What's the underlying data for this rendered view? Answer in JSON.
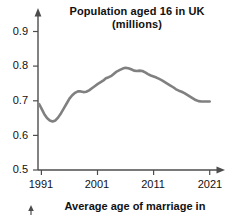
{
  "figure": {
    "background_color": "#ffffff",
    "line_color": "#808080",
    "axis_color": "#4d4d4d",
    "text_color": "#111111"
  },
  "title": {
    "line1": "Population aged 16 in UK",
    "line2": "(millions)"
  },
  "next_chart": {
    "partial_title": "Average age of marriage in"
  },
  "axes": {
    "y_tick_labels": [
      "0.9",
      "0.8",
      "0.7",
      "0.6",
      "0.5"
    ],
    "x_tick_labels": [
      "1991",
      "2001",
      "2011",
      "2021"
    ]
  },
  "chart_data": {
    "type": "line",
    "title": "Population aged 16 in UK (millions)",
    "xlabel": "",
    "ylabel": "",
    "xlim": [
      1990,
      2022
    ],
    "ylim": [
      0.5,
      0.93
    ],
    "yticks": [
      0.5,
      0.6,
      0.7,
      0.8,
      0.9
    ],
    "xticks": [
      1991,
      2001,
      2011,
      2021
    ],
    "grid": false,
    "legend": "none",
    "series": [
      {
        "name": "Population aged 16 in UK (millions)",
        "color": "#808080",
        "x": [
          1990.6,
          1991,
          1991.5,
          1992,
          1992.5,
          1993,
          1993.5,
          1994,
          1994.5,
          1995,
          1995.5,
          1996,
          1996.5,
          1997,
          1997.5,
          1998,
          1998.5,
          1999,
          1999.5,
          2000,
          2000.5,
          2001,
          2001.5,
          2002,
          2002.5,
          2003,
          2003.5,
          2004,
          2004.5,
          2005,
          2005.5,
          2006,
          2006.5,
          2007,
          2007.5,
          2008,
          2008.5,
          2009,
          2009.5,
          2010,
          2010.5,
          2011,
          2011.5,
          2012,
          2012.5,
          2013,
          2013.5,
          2014,
          2014.5,
          2015,
          2015.5,
          2016,
          2016.5,
          2017,
          2017.5,
          2018,
          2018.5,
          2019,
          2019.5,
          2020,
          2020.5,
          2021
        ],
        "y": [
          0.69,
          0.678,
          0.662,
          0.65,
          0.643,
          0.64,
          0.643,
          0.652,
          0.664,
          0.678,
          0.692,
          0.706,
          0.716,
          0.723,
          0.727,
          0.727,
          0.725,
          0.726,
          0.73,
          0.736,
          0.742,
          0.748,
          0.753,
          0.758,
          0.765,
          0.768,
          0.772,
          0.779,
          0.785,
          0.789,
          0.793,
          0.795,
          0.794,
          0.791,
          0.787,
          0.786,
          0.787,
          0.786,
          0.782,
          0.777,
          0.773,
          0.77,
          0.767,
          0.763,
          0.759,
          0.754,
          0.749,
          0.744,
          0.739,
          0.733,
          0.729,
          0.726,
          0.722,
          0.717,
          0.712,
          0.707,
          0.702,
          0.699,
          0.698,
          0.698,
          0.698,
          0.698
        ]
      }
    ]
  }
}
